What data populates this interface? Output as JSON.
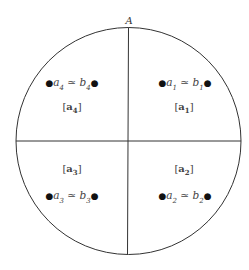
{
  "diagram": {
    "title": "A",
    "colors": {
      "stroke": "#333333",
      "text": "#444444",
      "background": "#ffffff"
    },
    "quadrants": [
      {
        "id": "q1",
        "position": "top-right",
        "relation": "a₁ ≃ b₁",
        "a": "a",
        "a_sub": "1",
        "b": "b",
        "b_sub": "1",
        "class_label": "[a₁]",
        "class_var": "a",
        "class_sub": "1"
      },
      {
        "id": "q2",
        "position": "bottom-right",
        "relation": "a₂ ≃ b₂",
        "a": "a",
        "a_sub": "2",
        "b": "b",
        "b_sub": "2",
        "class_label": "[a₂]",
        "class_var": "a",
        "class_sub": "2"
      },
      {
        "id": "q3",
        "position": "bottom-left",
        "relation": "a₃ ≃ b₃",
        "a": "a",
        "a_sub": "3",
        "b": "b",
        "b_sub": "3",
        "class_label": "[a₃]",
        "class_var": "a",
        "class_sub": "3"
      },
      {
        "id": "q4",
        "position": "top-left",
        "relation": "a₄ ≃ b₄",
        "a": "a",
        "a_sub": "4",
        "b": "b",
        "b_sub": "4",
        "class_label": "[a₄]",
        "class_var": "a",
        "class_sub": "4"
      }
    ],
    "symbols": {
      "simeq": "≃",
      "dot": "●",
      "lbracket": "[",
      "rbracket": "]"
    }
  }
}
